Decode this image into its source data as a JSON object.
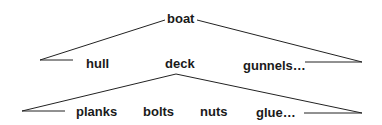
{
  "diagram": {
    "type": "tree",
    "root": {
      "label": "boat",
      "children": [
        {
          "label": "hull"
        },
        {
          "label": "deck",
          "children": [
            {
              "label": "planks"
            },
            {
              "label": "bolts"
            },
            {
              "label": "nuts"
            },
            {
              "label": "glue…"
            }
          ]
        },
        {
          "label": "gunnels…"
        }
      ]
    },
    "line_color": "#222222",
    "text_color": "#1a1a1a"
  },
  "labels": {
    "boat": "boat",
    "hull": "hull",
    "deck": "deck",
    "gunnels": "gunnels…",
    "planks": "planks",
    "bolts": "bolts",
    "nuts": "nuts",
    "glue": "glue…"
  }
}
